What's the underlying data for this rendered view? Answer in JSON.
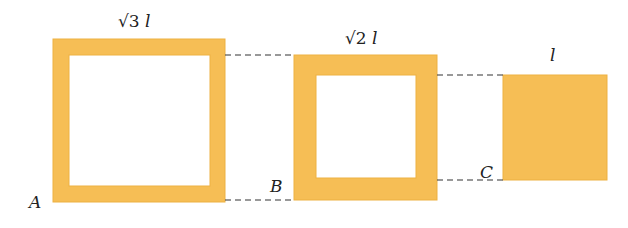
{
  "colors": {
    "fill": "#F6BE55",
    "edge": "#EDB143",
    "dash": "#333333",
    "text": "#222222",
    "background": "#FFFFFF"
  },
  "squares": [
    {
      "id": "A",
      "point_label": "A",
      "side_label_radical": "√3",
      "side_label_var": "l",
      "type": "hollow",
      "outer": {
        "x": 53,
        "y": 39,
        "w": 172,
        "h": 163
      },
      "inner": {
        "x": 69,
        "y": 55,
        "w": 141,
        "h": 131
      }
    },
    {
      "id": "B",
      "point_label": "B",
      "side_label_radical": "√2",
      "side_label_var": "l",
      "type": "hollow",
      "outer": {
        "x": 294,
        "y": 55,
        "w": 143,
        "h": 145
      },
      "inner": {
        "x": 316,
        "y": 75,
        "w": 100,
        "h": 103
      }
    },
    {
      "id": "C",
      "point_label": "C",
      "side_label_radical": "",
      "side_label_var": "l",
      "type": "solid",
      "outer": {
        "x": 503,
        "y": 75,
        "w": 104,
        "h": 105
      }
    }
  ],
  "dashed_lines": [
    {
      "x1": 225,
      "y1": 55,
      "x2": 294,
      "y2": 55
    },
    {
      "x1": 225,
      "y1": 200,
      "x2": 294,
      "y2": 200
    },
    {
      "x1": 437,
      "y1": 75,
      "x2": 503,
      "y2": 75
    },
    {
      "x1": 437,
      "y1": 180,
      "x2": 503,
      "y2": 180
    }
  ]
}
